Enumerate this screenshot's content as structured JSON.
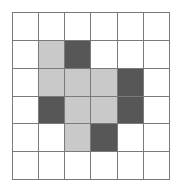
{
  "grid": {
    "rows": 6,
    "cols": 6,
    "colors": {
      "empty": "#ffffff",
      "light": "#c9c9c9",
      "dark": "#575757",
      "line": "#7a7a7a"
    },
    "cells": [
      [
        "empty",
        "empty",
        "empty",
        "empty",
        "empty",
        "empty"
      ],
      [
        "empty",
        "light",
        "dark",
        "empty",
        "empty",
        "empty"
      ],
      [
        "empty",
        "light",
        "light",
        "light",
        "dark",
        "empty"
      ],
      [
        "empty",
        "dark",
        "light",
        "light",
        "dark",
        "empty"
      ],
      [
        "empty",
        "empty",
        "light",
        "dark",
        "empty",
        "empty"
      ],
      [
        "empty",
        "empty",
        "empty",
        "empty",
        "empty",
        "empty"
      ]
    ]
  }
}
